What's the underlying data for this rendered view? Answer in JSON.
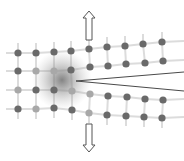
{
  "diagram": {
    "colors": {
      "background": "#ffffff",
      "atom": "#6a6a6a",
      "atom_light": "#a8a8a8",
      "bond": "#dcdcdc",
      "crack_line": "#4a4a4a",
      "process_zone": "#7a7a7a",
      "arrow_stroke": "#555555"
    },
    "arrows": [
      {
        "name": "load-arrow-up",
        "direction": "up",
        "x": 89,
        "y_tip": 11,
        "y_tail": 40
      },
      {
        "name": "load-arrow-down",
        "direction": "down",
        "x": 89,
        "y_tip": 152,
        "y_tail": 124
      }
    ],
    "process_zone": {
      "cx": 62,
      "cy": 80,
      "r": 30
    },
    "crack": {
      "tip": [
        76,
        81
      ],
      "upper_end": [
        184,
        72
      ],
      "lower_end": [
        184,
        91
      ]
    },
    "rows": [
      [
        [
          18,
          53
        ],
        [
          36,
          53
        ],
        [
          54,
          52
        ],
        [
          71,
          51
        ],
        [
          89,
          49
        ],
        [
          107,
          47
        ],
        [
          125,
          46
        ],
        [
          143,
          44
        ],
        [
          162,
          42
        ]
      ],
      [
        [
          18,
          71
        ],
        [
          36,
          71
        ],
        [
          54,
          71
        ],
        [
          71,
          70
        ],
        [
          90,
          67
        ],
        [
          108,
          66
        ],
        [
          126,
          64
        ],
        [
          145,
          63
        ],
        [
          163,
          61
        ]
      ],
      [
        [
          18,
          90
        ],
        [
          36,
          90
        ],
        [
          54,
          90
        ],
        [
          72,
          91
        ],
        [
          90,
          94
        ],
        [
          108,
          96
        ],
        [
          127,
          97
        ],
        [
          145,
          99
        ],
        [
          163,
          100
        ]
      ],
      [
        [
          18,
          109
        ],
        [
          36,
          109
        ],
        [
          54,
          108
        ],
        [
          72,
          110
        ],
        [
          89,
          113
        ],
        [
          107,
          115
        ],
        [
          126,
          116
        ],
        [
          144,
          117
        ],
        [
          162,
          118
        ]
      ]
    ],
    "light_atoms": [
      [
        1,
        1
      ],
      [
        1,
        2
      ],
      [
        2,
        0
      ],
      [
        2,
        3
      ],
      [
        3,
        1
      ],
      [
        3,
        4
      ],
      [
        2,
        4
      ]
    ]
  }
}
